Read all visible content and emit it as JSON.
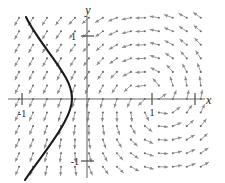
{
  "chart_data": {
    "type": "scatter",
    "title": "",
    "subtitle": "",
    "xlabel": "x",
    "ylabel": "y",
    "xlim": [
      -1.45,
      1.9
    ],
    "ylim": [
      -1.45,
      1.45
    ],
    "grid": false,
    "legend": null,
    "annotations": [],
    "axes": {
      "x_axis_label": "x",
      "y_axis_label": "y",
      "x_ticks": [
        {
          "value": -1,
          "label": "-1"
        },
        {
          "value": 1,
          "label": "1"
        },
        {
          "value": 1.66,
          "label": ""
        }
      ],
      "y_ticks": [
        {
          "value": 1,
          "label": "1"
        },
        {
          "value": -1,
          "label": "-1"
        }
      ]
    },
    "vector_field": {
      "description": "slope field arrows",
      "arrow_color": "#8a8a8a",
      "spiral_center": [
        1,
        0
      ],
      "spiral_direction": "counterclockwise",
      "arrow_count": 176
    },
    "solution_curve": {
      "description": "bold separatrix curve",
      "color": "#1a1a1a",
      "points": [
        [
          -1.0,
          1.25
        ],
        [
          -0.88,
          1.0
        ],
        [
          -0.62,
          0.62
        ],
        [
          -0.4,
          0.3
        ],
        [
          -0.27,
          0.1
        ],
        [
          -0.23,
          0.0
        ],
        [
          -0.28,
          -0.16
        ],
        [
          -0.45,
          -0.45
        ],
        [
          -0.72,
          -0.85
        ],
        [
          -0.95,
          -1.22
        ]
      ]
    }
  },
  "labels": {
    "x_axis": "x",
    "y_axis": "y",
    "x_neg_one": "-1",
    "x_pos_one": "1",
    "y_pos_one": "1",
    "y_neg_one": "-1"
  }
}
